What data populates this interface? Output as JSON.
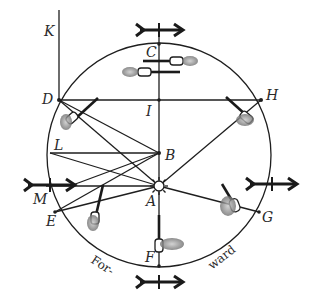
{
  "figure": {
    "colors": {
      "ink": "#1e1e1e",
      "flame": "#8a8a8a",
      "background": "#ffffff"
    }
  },
  "labels": {
    "K": "K",
    "C": "C",
    "D": "D",
    "H": "H",
    "I": "I",
    "L": "L",
    "B": "B",
    "M": "M",
    "A": "A",
    "E": "E",
    "G": "G",
    "F": "F"
  },
  "caption": {
    "left": "For-",
    "right": "ward"
  },
  "arrows": [
    {
      "id": "top",
      "direction": "right"
    },
    {
      "id": "left",
      "direction": "right"
    },
    {
      "id": "right",
      "direction": "right"
    },
    {
      "id": "bottom",
      "direction": "right"
    }
  ],
  "icons": {
    "center_star": "sun-star-icon",
    "wick": "candle-flame-icon"
  }
}
